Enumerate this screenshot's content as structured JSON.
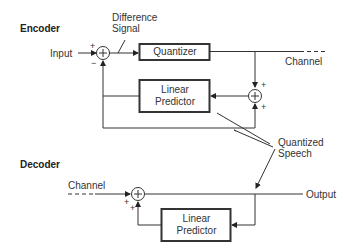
{
  "encoder": {
    "title": "Encoder",
    "input_label": "Input",
    "difference_signal_label": "Difference Signal",
    "difference_line1": "Difference",
    "difference_line2": "Signal",
    "quantizer_label": "Quantizer",
    "predictor_line1": "Linear",
    "predictor_line2": "Predictor",
    "channel_label": "Channel",
    "summer1_signs": [
      "+",
      "−"
    ],
    "summer2_signs": [
      "+",
      "+"
    ]
  },
  "shared": {
    "quantized_speech_line1": "Quantized",
    "quantized_speech_line2": "Speech"
  },
  "decoder": {
    "title": "Decoder",
    "channel_label": "Channel",
    "output_label": "Output",
    "predictor_line1": "Linear",
    "predictor_line2": "Predictor",
    "summer_signs": [
      "+",
      "+"
    ]
  },
  "summer_symbol": "+"
}
